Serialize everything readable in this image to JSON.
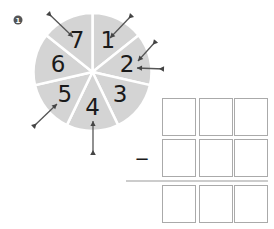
{
  "problem": {
    "number": "1",
    "operator": "−"
  },
  "spinner": {
    "segments": [
      "1",
      "2",
      "3",
      "4",
      "5",
      "6",
      "7"
    ],
    "fill_color": "#d4d4d4",
    "divider_color": "#ffffff",
    "digit_color": "#1a1a1a",
    "darts": [
      {
        "target": "7"
      },
      {
        "target": "1"
      },
      {
        "target": "2"
      },
      {
        "target": "2"
      },
      {
        "target": "5"
      },
      {
        "target": "4"
      }
    ]
  },
  "subtraction_grid": {
    "rows": 3,
    "columns": 3,
    "cells": [
      [
        "",
        "",
        ""
      ],
      [
        "",
        "",
        ""
      ],
      [
        "",
        "",
        ""
      ]
    ],
    "box_border_color": "#aaaaaa"
  }
}
